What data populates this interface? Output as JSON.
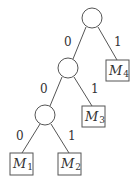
{
  "diagram": {
    "type": "binary-tree",
    "internal_nodes": [
      {
        "id": "root"
      },
      {
        "id": "n1"
      },
      {
        "id": "n2"
      }
    ],
    "leaves": [
      {
        "id": "M4",
        "base": "M",
        "sub": "4"
      },
      {
        "id": "M3",
        "base": "M",
        "sub": "3"
      },
      {
        "id": "M1",
        "base": "M",
        "sub": "1"
      },
      {
        "id": "M2",
        "base": "M",
        "sub": "2"
      }
    ],
    "edges": [
      {
        "from": "root",
        "to": "n1",
        "label": "0"
      },
      {
        "from": "root",
        "to": "M4",
        "label": "1"
      },
      {
        "from": "n1",
        "to": "n2",
        "label": "0"
      },
      {
        "from": "n1",
        "to": "M3",
        "label": "1"
      },
      {
        "from": "n2",
        "to": "M1",
        "label": "0"
      },
      {
        "from": "n2",
        "to": "M2",
        "label": "1"
      }
    ]
  }
}
